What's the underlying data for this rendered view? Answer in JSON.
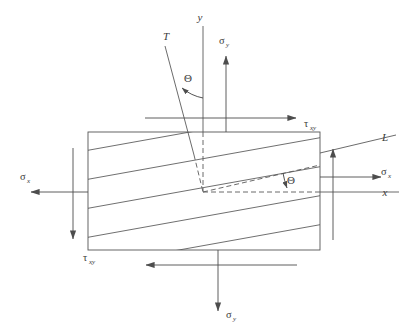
{
  "figure": {
    "type": "engineering-stress-element-diagram",
    "background_color": "#ffffff",
    "line_color": "#555555",
    "text_color": "#3a3a3a"
  },
  "labels": {
    "axis_y": "y",
    "axis_x": "x",
    "axis_T": "T",
    "axis_L": "L",
    "theta_upper": "Θ",
    "theta_inner": "Θ",
    "sigma_y_top": "σ",
    "sigma_y_top_sub": "y",
    "sigma_y_bottom": "σ",
    "sigma_y_bottom_sub": "y",
    "sigma_x_left": "σ",
    "sigma_x_left_sub": "x",
    "sigma_x_right": "σ",
    "sigma_x_right_sub": "x",
    "tau_xy_top": "τ",
    "tau_xy_top_sub": "xy",
    "tau_xy_bottom": "τ",
    "tau_xy_bottom_sub": "xy"
  },
  "geometry": {
    "element_rect": {
      "x": 88,
      "y": 132,
      "width": 232,
      "height": 118
    },
    "origin": {
      "x": 203,
      "y": 192
    },
    "fiber_angle_deg": 10,
    "hatch_line_count": 5,
    "y_axis": {
      "x": 203,
      "y_top": 26,
      "y_bottom": 132
    },
    "x_axis": {
      "y": 192,
      "x_left": 320,
      "x_right": 400
    },
    "T_axis": {
      "x1": 163,
      "y1": 45,
      "x2": 203,
      "y2": 192
    },
    "L_axis": {
      "x1": 203,
      "y1": 192,
      "x2": 396,
      "y2": 147
    }
  },
  "arrows": {
    "sigma_y_top": {
      "direction": "up",
      "x": 226,
      "y_from": 132,
      "y_to": 55
    },
    "sigma_y_bottom": {
      "direction": "down",
      "x": 218,
      "y_from": 250,
      "y_to": 312
    },
    "sigma_x_left": {
      "direction": "left",
      "y": 192,
      "x_from": 88,
      "x_to": 30
    },
    "sigma_x_right": {
      "direction": "right",
      "y": 177,
      "x_from": 320,
      "x_to": 382
    },
    "tau_xy_top": {
      "direction": "right",
      "y": 118,
      "x_from": 145,
      "x_to": 297
    },
    "tau_xy_bottom": {
      "direction": "left",
      "y": 265,
      "x_from": 297,
      "x_to": 145
    },
    "tau_xy_left": {
      "direction": "down",
      "x": 73,
      "y_from": 148,
      "y_to": 240
    },
    "tau_xy_right": {
      "direction": "up",
      "x": 333,
      "y_from": 240,
      "y_to": 148
    }
  }
}
